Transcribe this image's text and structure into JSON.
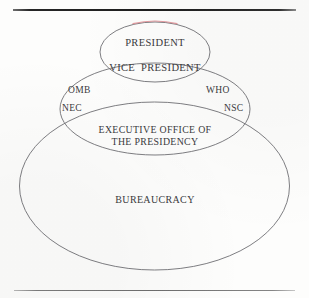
{
  "page": {
    "background_color": "#fdfdfc",
    "ink_color": "#3a3a3c",
    "stroke_color": "#6b6b70",
    "highlight_color": "#e08c92"
  },
  "rules": {
    "top": {
      "name": "top-divider"
    },
    "bottom": {
      "name": "bottom-divider"
    }
  },
  "diagram": {
    "ellipses": [
      {
        "id": "bureaucracy",
        "label": "BUREAUCRACY"
      },
      {
        "id": "eop",
        "label": "EXECUTIVE OFFICE OF\nTHE PRESIDENCY"
      },
      {
        "id": "president",
        "label": "PRESIDENT"
      }
    ],
    "labels": {
      "president": "PRESIDENT",
      "vice_president": "VICE  PRESIDENT",
      "omb": "OMB",
      "who": "WHO",
      "nec": "NEC",
      "nsc": "NSC",
      "eop_line1": "EXECUTIVE OFFICE OF",
      "eop_line2": "THE PRESIDENCY",
      "bureaucracy": "BUREAUCRACY"
    }
  }
}
